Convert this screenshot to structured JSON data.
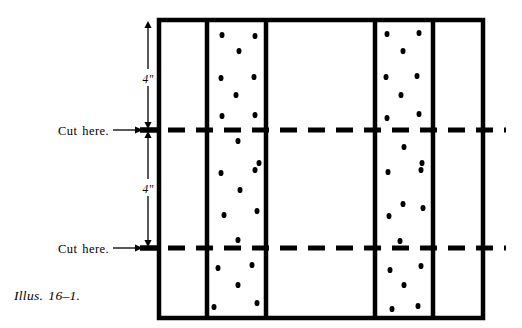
{
  "figure": {
    "caption": "Illus. 16–1.",
    "background_color": "#ffffff",
    "ink_color": "#000000",
    "width": 522,
    "height": 328
  },
  "board": {
    "name": "board-outline",
    "left": 159,
    "top": 20,
    "right": 483,
    "bottom": 318,
    "stroke_width": 4.5,
    "vertical_dividers": [
      207,
      266,
      375,
      433
    ],
    "panels": [
      {
        "name": "panel-plain-left",
        "x1": 159,
        "x2": 207,
        "dotted": false
      },
      {
        "name": "panel-dotted-left",
        "x1": 207,
        "x2": 266,
        "dotted": true
      },
      {
        "name": "panel-plain-center",
        "x1": 266,
        "x2": 375,
        "dotted": false
      },
      {
        "name": "panel-dotted-right",
        "x1": 375,
        "x2": 433,
        "dotted": true
      },
      {
        "name": "panel-plain-right",
        "x1": 433,
        "x2": 483,
        "dotted": false
      }
    ]
  },
  "cut_lines": [
    {
      "name": "cut-line-upper",
      "y": 130,
      "x_start": 140,
      "x_end": 506,
      "dash": "17 11",
      "stroke_width": 5
    },
    {
      "name": "cut-line-lower",
      "y": 248,
      "x_start": 140,
      "x_end": 506,
      "dash": "17 11",
      "stroke_width": 5
    }
  ],
  "dimensions": [
    {
      "name": "dimension-upper",
      "label": "4\"",
      "x": 148,
      "y_top": 21,
      "y_bottom": 129,
      "label_y": 80
    },
    {
      "name": "dimension-lower",
      "label": "4\"",
      "x": 148,
      "y_top": 131,
      "y_bottom": 247,
      "label_y": 190
    }
  ],
  "callouts": [
    {
      "name": "callout-cut-here-upper",
      "label": "Cut here.",
      "text_x": 58,
      "text_y": 125,
      "arrow_x1": 113,
      "arrow_x2": 143,
      "arrow_y": 130
    },
    {
      "name": "callout-cut-here-lower",
      "label": "Cut here.",
      "text_x": 58,
      "text_y": 243,
      "arrow_x1": 113,
      "arrow_x2": 143,
      "arrow_y": 248
    }
  ],
  "dots": {
    "radius_x": 2.5,
    "radius_y": 3.1,
    "panel_dotted_left": [
      [
        222,
        35
      ],
      [
        255,
        36
      ],
      [
        239,
        51
      ],
      [
        221,
        78
      ],
      [
        254,
        77
      ],
      [
        236,
        95
      ],
      [
        222,
        116
      ],
      [
        255,
        115
      ],
      [
        238,
        141
      ],
      [
        259,
        163
      ],
      [
        221,
        173
      ],
      [
        255,
        170
      ],
      [
        240,
        190
      ],
      [
        224,
        215
      ],
      [
        257,
        211
      ],
      [
        238,
        240
      ],
      [
        218,
        268
      ],
      [
        252,
        265
      ],
      [
        238,
        285
      ],
      [
        214,
        307
      ],
      [
        257,
        303
      ]
    ],
    "panel_dotted_right": [
      [
        387,
        34
      ],
      [
        419,
        33
      ],
      [
        403,
        51
      ],
      [
        386,
        77
      ],
      [
        417,
        76
      ],
      [
        401,
        95
      ],
      [
        387,
        118
      ],
      [
        419,
        114
      ],
      [
        404,
        147
      ],
      [
        422,
        163
      ],
      [
        388,
        172
      ],
      [
        421,
        170
      ],
      [
        403,
        204
      ],
      [
        389,
        216
      ],
      [
        423,
        208
      ],
      [
        400,
        241
      ],
      [
        390,
        270
      ],
      [
        421,
        266
      ],
      [
        404,
        285
      ],
      [
        418,
        306
      ],
      [
        392,
        309
      ]
    ]
  }
}
